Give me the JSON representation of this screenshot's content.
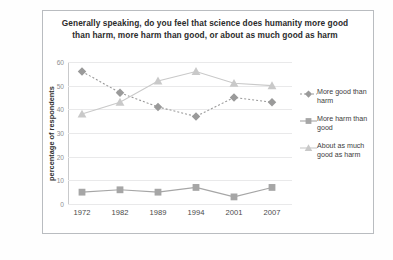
{
  "chart_data": {
    "type": "line",
    "title": "Generally speaking, do you feel that science does humanity more good than harm, more harm than good, or about as much good as harm",
    "xlabel": "",
    "ylabel": "percentage of respondents",
    "categories": [
      "1972",
      "1982",
      "1989",
      "1994",
      "2001",
      "2007"
    ],
    "ylim": [
      0,
      60
    ],
    "yticks": [
      "0",
      "10",
      "20",
      "30",
      "40",
      "50",
      "60"
    ],
    "grid": true,
    "legend_position": "right",
    "series": [
      {
        "name": "More good than harm",
        "marker": "diamond",
        "linestyle": "dotted",
        "color": "#9a9a9a",
        "values": [
          56,
          47,
          41,
          37,
          45,
          43
        ]
      },
      {
        "name": "More harm than good",
        "marker": "square",
        "linestyle": "solid",
        "color": "#a6a6a6",
        "values": [
          5,
          6,
          5,
          7,
          3,
          7
        ]
      },
      {
        "name": "About as much good as harm",
        "marker": "triangle",
        "linestyle": "solid",
        "color": "#c9c9c9",
        "values": [
          38,
          43,
          52,
          56,
          51,
          50
        ]
      }
    ]
  },
  "legend": {
    "items": [
      "More good than harm",
      "More harm than good",
      "About as much good as harm"
    ]
  },
  "colors": {
    "frame": "#b9bcc0",
    "grid": "#e9e9ea",
    "text": "#2b2b2b",
    "tick": "#8d8f92"
  }
}
